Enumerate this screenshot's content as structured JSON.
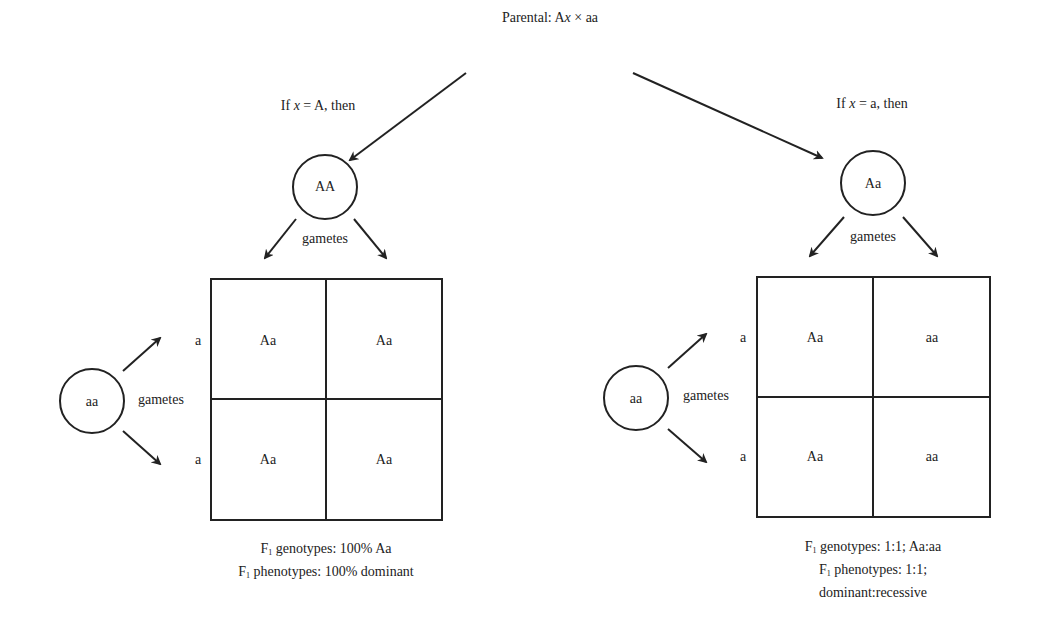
{
  "title": {
    "prefix": "Parental: A",
    "var": "x",
    "suffix": " × aa"
  },
  "left_branch": {
    "condition_prefix": "If ",
    "condition_var": "x",
    "condition_suffix": " = A, then",
    "parent_genotype": "AA",
    "gametes_label_top": "gametes",
    "other_parent": "aa",
    "gametes_label_side": "gametes",
    "row_gametes": [
      "a",
      "a"
    ],
    "cells": [
      [
        "Aa",
        "Aa"
      ],
      [
        "Aa",
        "Aa"
      ]
    ],
    "summary": {
      "genotype_prefix": "F",
      "genotype_sub": "1",
      "genotype_text": " genotypes: 100% Aa",
      "phenotype_prefix": "F",
      "phenotype_sub": "1",
      "phenotype_text": " phenotypes: 100% dominant"
    }
  },
  "right_branch": {
    "condition_prefix": "If ",
    "condition_var": "x",
    "condition_suffix": " = a, then",
    "parent_genotype": "Aa",
    "gametes_label_top": "gametes",
    "other_parent": "aa",
    "gametes_label_side": "gametes",
    "row_gametes": [
      "a",
      "a"
    ],
    "cells": [
      [
        "Aa",
        "aa"
      ],
      [
        "Aa",
        "aa"
      ]
    ],
    "summary": {
      "genotype_prefix": "F",
      "genotype_sub": "1",
      "genotype_text": " genotypes: 1:1; Aa:aa",
      "phenotype_prefix": "F",
      "phenotype_sub": "1",
      "phenotype_text": " phenotypes: 1:1;",
      "phenotype_line3": "dominant:recessive"
    }
  },
  "colors": {
    "stroke": "#222222",
    "background": "#ffffff"
  }
}
